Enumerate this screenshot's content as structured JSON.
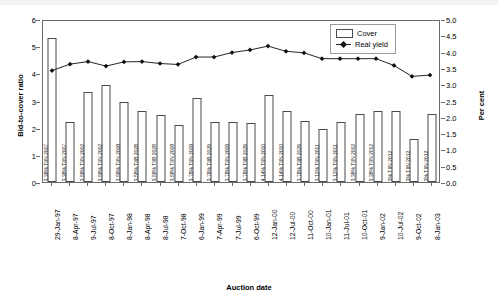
{
  "chart_data": {
    "type": "bar",
    "title": "",
    "xlabel": "Auction date",
    "ylabel": "Bid-to-cover ratio",
    "y2label": "Per cent",
    "ylim": [
      0,
      6
    ],
    "y2lim": [
      0,
      5
    ],
    "yticks": [
      "0",
      "1",
      "2",
      "3",
      "4",
      "5",
      "6"
    ],
    "y2ticks": [
      "0.0",
      "0.5",
      "1.0",
      "1.5",
      "2.0",
      "2.5",
      "3.0",
      "3.5",
      "4.0",
      "4.5",
      "5.0"
    ],
    "grid": false,
    "legend_position": "top-right",
    "legend": [
      "Cover",
      "Real yield"
    ],
    "categories": [
      "29-Jan-97",
      "8-Apr-97",
      "9-Jul-97",
      "8-Oct-97",
      "8-Jan-98",
      "8-Apr-98",
      "8-Jul-98",
      "7-Oct-98",
      "6-Jan-99",
      "7-Apr-99",
      "7-Jul-99",
      "6-Oct-99",
      "12-Jan-00",
      "12-Jul-00",
      "11-Oct-00",
      "10-Jan-01",
      "11-Jul-01",
      "10-Oct-01",
      "9-Jan-02",
      "10-Jul-02",
      "9-Oct-02",
      "8-Jan-03"
    ],
    "bar_labels": [
      "3.38% TIIN 2007",
      "3.38% TIIN 2007",
      "3.58% TIIN 2002",
      "3.58% TIIN 2002",
      "3.58% TIIN 2008",
      "3.58% TIIB 2028",
      "3.58% TIIB 2028",
      "3.58% TIIN 2008",
      "3.78% TIIN 2009",
      "3.78% TIIB 2029",
      "3.78% TIIN 2009",
      "3.78% TIIB 2029",
      "4.14% TIIN 2010",
      "4.14% TIIN 2010",
      "3.78% TIIB 2029",
      "3.12% TIIN 2011",
      "3.12% TIIN 2011",
      "3.38% TIIN 2002",
      "3.38% TIIN 2012",
      "3% TIIN 2012",
      "3% TIIN 2012",
      "3% TIIN 2012"
    ],
    "series": [
      {
        "name": "Cover",
        "axis": "left",
        "type": "bar",
        "values": [
          5.3,
          2.2,
          3.31,
          3.56,
          2.95,
          2.6,
          2.45,
          2.1,
          3.11,
          2.22,
          2.22,
          2.18,
          3.2,
          2.6,
          2.25,
          1.95,
          2.2,
          2.52,
          2.6,
          2.62,
          1.6,
          2.5
        ]
      },
      {
        "name": "Real yield",
        "axis": "right",
        "type": "line",
        "marker": "diamond",
        "values": [
          3.46,
          3.66,
          3.74,
          3.6,
          3.73,
          3.74,
          3.68,
          3.65,
          3.88,
          3.88,
          4.02,
          4.1,
          4.22,
          4.06,
          4.01,
          3.83,
          3.83,
          3.83,
          3.83,
          3.62,
          3.28,
          3.32
        ]
      }
    ]
  },
  "legend": {
    "cover": "Cover",
    "real_yield": "Real yield"
  },
  "axes": {
    "y_left_title": "Bid-to-cover ratio",
    "y_right_title": "Per cent",
    "x_title": "Auction date"
  }
}
